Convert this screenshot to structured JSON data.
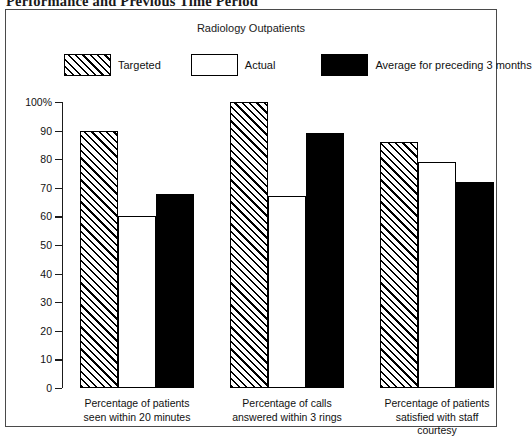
{
  "page_heading": "Performance and Previous Time Period",
  "figure": {
    "title": "Radiology Outpatients"
  },
  "legend": {
    "items": [
      {
        "key": "targeted",
        "label": "Targeted",
        "swatch": "hatched-rectangle",
        "color": "#000000"
      },
      {
        "key": "actual",
        "label": "Actual",
        "swatch": "white-rectangle",
        "color": "#ffffff"
      },
      {
        "key": "average",
        "label": "Average for preceding 3 months",
        "swatch": "black-rectangle",
        "color": "#000000"
      }
    ]
  },
  "chart_data": {
    "type": "bar",
    "title": "Radiology Outpatients",
    "xlabel": "",
    "ylabel": "",
    "ylim": [
      0,
      100
    ],
    "ytick_labels": [
      "0",
      "10",
      "20",
      "30",
      "40",
      "50",
      "60",
      "70",
      "80",
      "90",
      "100%"
    ],
    "ytick_values": [
      0,
      10,
      20,
      30,
      40,
      50,
      60,
      70,
      80,
      90,
      100
    ],
    "grid": false,
    "legend_position": "top",
    "categories": [
      "Percentage of patients seen within 20 minutes",
      "Percentage of calls answered within 3 rings",
      "Percentage of patients satisfied with staff courtesy"
    ],
    "category_lines": [
      [
        "Percentage of patients",
        "seen within 20 minutes"
      ],
      [
        "Percentage of calls",
        "answered within 3 rings"
      ],
      [
        "Percentage of patients",
        "satisfied with staff",
        "courtesy"
      ]
    ],
    "series": [
      {
        "name": "Targeted",
        "values": [
          90,
          100,
          86
        ]
      },
      {
        "name": "Actual",
        "values": [
          60,
          67,
          79
        ]
      },
      {
        "name": "Average for preceding 3 months",
        "values": [
          68,
          89,
          72
        ]
      }
    ]
  }
}
